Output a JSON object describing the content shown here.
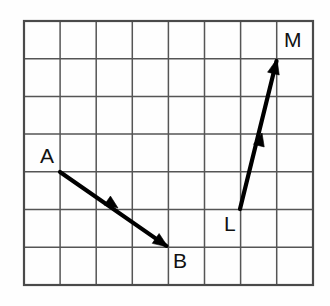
{
  "figure": {
    "background_color": "#fefefe",
    "grid_line_color": "#555555",
    "grid_border_color": "#4a4a4a",
    "vector_color": "#000000",
    "label_color": "#111111"
  },
  "grid": {
    "columns": 8,
    "rows": 7,
    "left": 24,
    "top": 21,
    "cell_width": 36.1,
    "cell_height": 37.7,
    "right": 313,
    "bottom": 285,
    "show_grid": true
  },
  "labels": {
    "a": "A",
    "b": "B",
    "l": "L",
    "m": "M"
  },
  "chart_data": {
    "type": "diagram",
    "grid": {
      "columns": 8,
      "rows": 7,
      "cell_size_px": 36
    },
    "vectors": [
      {
        "name": "AB",
        "tail_label": "A",
        "head_label": "B",
        "tail_grid": [
          1,
          4
        ],
        "head_grid": [
          4,
          6
        ],
        "tail_px": [
          60,
          172
        ],
        "head_px": [
          168,
          247
        ],
        "components_grid": [
          3,
          -2
        ],
        "direction": "right and down",
        "mid_arrow_px": [
          118,
          208
        ]
      },
      {
        "name": "LM",
        "tail_label": "L",
        "head_label": "M",
        "tail_grid": [
          6,
          5
        ],
        "head_grid": [
          7,
          1
        ],
        "tail_px": [
          240,
          209
        ],
        "head_px": [
          277,
          59
        ],
        "components_grid": [
          1,
          4
        ],
        "direction": "right and up",
        "mid_arrow_px": [
          262,
          133
        ]
      }
    ],
    "label_positions_px": {
      "A": [
        40,
        163
      ],
      "B": [
        173,
        268
      ],
      "L": [
        224,
        231
      ],
      "M": [
        284,
        47
      ]
    }
  }
}
